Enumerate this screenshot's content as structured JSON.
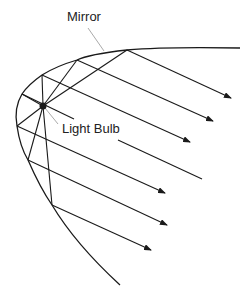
{
  "diagram": {
    "labels": {
      "mirror": "Mirror",
      "bulb": "Light Bulb"
    },
    "colors": {
      "line": "#1a1a1a",
      "leader": "#aaaaaa",
      "background": "#ffffff"
    }
  }
}
